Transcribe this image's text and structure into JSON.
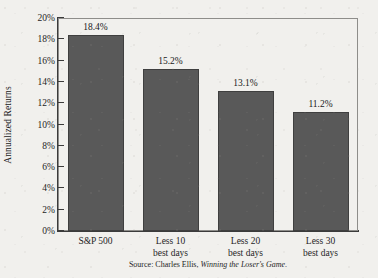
{
  "chart_data": {
    "type": "bar",
    "title": "",
    "xlabel": "",
    "ylabel": "Annualized Returns",
    "ylim": [
      0,
      20
    ],
    "ytick_step": 2,
    "grid": false,
    "legend": "none",
    "categories": [
      "S&P 500",
      "Less 10 best days",
      "Less 20 best days",
      "Less 30 best days"
    ],
    "category_lines": [
      [
        "S&P 500",
        ""
      ],
      [
        "Less 10",
        "best days"
      ],
      [
        "Less 20",
        "best days"
      ],
      [
        "Less 30",
        "best days"
      ]
    ],
    "values": [
      18.4,
      15.2,
      13.1,
      11.2
    ],
    "value_labels": [
      "18.4%",
      "15.2%",
      "13.1%",
      "11.2%"
    ],
    "ytick_labels": [
      "0%",
      "2%",
      "4%",
      "6%",
      "8%",
      "10%",
      "12%",
      "14%",
      "16%",
      "18%",
      "20%"
    ],
    "ytick_values": [
      0,
      2,
      4,
      6,
      8,
      10,
      12,
      14,
      16,
      18,
      20
    ],
    "colors": {
      "bar_fill": "#595959",
      "bar_edge": "#3f3f3f",
      "axis": "#3b3b3b",
      "frame": "#8e8d8a",
      "background": "#f1f0ed",
      "text": "#1a1a1a"
    }
  },
  "source": {
    "prefix": "Source: Charles Ellis, ",
    "title": "Winning the Loser's Game",
    "suffix": "."
  }
}
